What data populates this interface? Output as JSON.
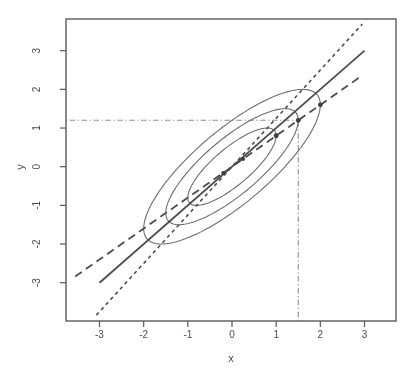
{
  "chart_data": {
    "type": "line",
    "title": "",
    "xlabel": "x",
    "ylabel": "y",
    "x_ticks": [
      -3,
      -2,
      -1,
      0,
      1,
      2,
      3
    ],
    "y_ticks": [
      -3,
      -2,
      -1,
      0,
      1,
      2,
      3
    ],
    "xlim": [
      -3.76,
      3.71
    ],
    "ylim": [
      -3.99,
      3.82
    ],
    "grid": false,
    "legend": "none",
    "correlation_rho": 0.8,
    "contour_ellipses": [
      {
        "level": 1.0,
        "semi_major": 1.342,
        "semi_minor": 0.447,
        "angle_deg": 45,
        "center": [
          0,
          0
        ]
      },
      {
        "level": 1.5,
        "semi_major": 2.012,
        "semi_minor": 0.671,
        "angle_deg": 45,
        "center": [
          0,
          0
        ]
      },
      {
        "level": 2.0,
        "semi_major": 2.683,
        "semi_minor": 0.894,
        "angle_deg": 45,
        "center": [
          0,
          0
        ]
      }
    ],
    "lines": [
      {
        "name": "sd-line",
        "style": "solid",
        "slope": 1.0,
        "intercept": 0,
        "x_from": -3.0,
        "x_to": 3.0
      },
      {
        "name": "regression-y-on-x",
        "style": "longdash",
        "slope": 0.8,
        "intercept": 0,
        "x_from": -3.55,
        "x_to": 2.95
      },
      {
        "name": "regression-x-on-y",
        "style": "shortdash",
        "slope": 1.25,
        "intercept": 0,
        "x_from": -3.07,
        "x_to": 2.95
      }
    ],
    "guide_lines": [
      {
        "name": "horizontal-guide",
        "style": "dotdash",
        "y": 1.2,
        "x_from": -3.76,
        "x_to": 1.5
      },
      {
        "name": "vertical-guide",
        "style": "dotdash",
        "x": 1.5,
        "y_from": -3.99,
        "y_to": 1.2
      }
    ],
    "points": [
      {
        "x": 2.0,
        "y": 1.6,
        "r": 2.4
      },
      {
        "x": 1.5,
        "y": 1.2,
        "r": 2.4
      },
      {
        "x": 1.0,
        "y": 0.8,
        "r": 2.4
      },
      {
        "x": 0.25,
        "y": 0.2,
        "r": 2.0
      },
      {
        "x": -0.2,
        "y": -0.16,
        "r": 2.0
      }
    ],
    "colors": {
      "background": "#ffffff",
      "line": "#4d4d4d",
      "ellipse": "#6e6e6e",
      "guide": "#8f8f8f",
      "point": "#3e3e3e",
      "text": "#4c4c4c",
      "frame": "#5a5a5a"
    }
  }
}
